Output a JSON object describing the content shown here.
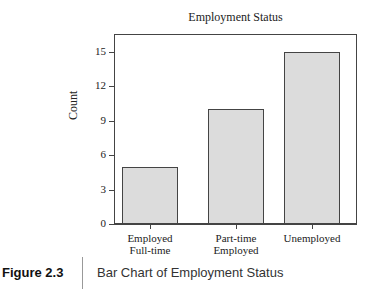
{
  "chart_data": {
    "type": "bar",
    "title": "Employment Status",
    "xlabel": "",
    "ylabel": "Count",
    "categories": [
      "Employed\nFull-time",
      "Part-time\nEmployed",
      "Unemployed"
    ],
    "category_lines": [
      [
        "Employed",
        "Full-time"
      ],
      [
        "Part-time",
        "Employed"
      ],
      [
        "Unemployed"
      ]
    ],
    "values": [
      5,
      10,
      15
    ],
    "yticks": [
      0,
      3,
      6,
      9,
      12,
      15
    ],
    "ylim": [
      0,
      16.4
    ],
    "grid": false,
    "bar_color": "#dcdcdc",
    "edge_color": "#444444"
  },
  "caption": {
    "figure_label": "Figure 2.3",
    "text": "Bar Chart of Employment Status"
  }
}
